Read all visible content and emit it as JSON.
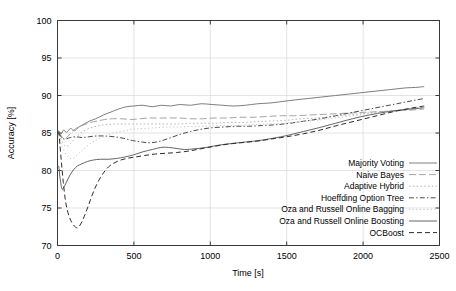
{
  "chart_data": {
    "type": "line",
    "title": "",
    "xlabel": "Time [s]",
    "ylabel": "Accuracy [%]",
    "xlim": [
      0,
      2500
    ],
    "ylim": [
      70,
      100
    ],
    "xticks": [
      0,
      500,
      1000,
      1500,
      2000,
      2500
    ],
    "yticks": [
      70,
      75,
      80,
      85,
      90,
      95,
      100
    ],
    "xtick_labels": [
      "0",
      "500",
      "1000",
      "1500",
      "2000",
      "2500"
    ],
    "ytick_labels": [
      "70",
      "75",
      "80",
      "85",
      "90",
      "95",
      "100"
    ],
    "grid": true,
    "grid_style": "light-solid",
    "legend_position": "lower-right-inside",
    "series": [
      {
        "name": "Majority Voting",
        "style": "solid",
        "color": "#6f6f6f",
        "width": 0.9,
        "x": [
          10,
          25,
          40,
          60,
          85,
          110,
          140,
          175,
          210,
          250,
          300,
          350,
          400,
          450,
          500,
          560,
          620,
          680,
          740,
          800,
          870,
          940,
          1010,
          1080,
          1150,
          1230,
          1310,
          1390,
          1470,
          1550,
          1640,
          1730,
          1820,
          1910,
          2000,
          2090,
          2180,
          2270,
          2360,
          2400
        ],
        "y": [
          85.2,
          84.9,
          85.4,
          85.1,
          85.6,
          85.3,
          85.8,
          86.2,
          86.6,
          86.9,
          87.4,
          87.8,
          88.2,
          88.5,
          88.6,
          88.7,
          88.5,
          88.7,
          88.6,
          88.8,
          88.7,
          88.9,
          88.8,
          88.7,
          88.6,
          88.7,
          88.9,
          89.0,
          89.2,
          89.4,
          89.6,
          89.8,
          90.0,
          90.2,
          90.4,
          90.6,
          90.8,
          91.0,
          91.1,
          91.2
        ]
      },
      {
        "name": "Naive Bayes",
        "style": "long-dash",
        "color": "#9a9a9a",
        "width": 0.9,
        "x": [
          10,
          25,
          45,
          70,
          100,
          135,
          175,
          215,
          260,
          310,
          360,
          420,
          480,
          540,
          600,
          660,
          730,
          800,
          870,
          950,
          1030,
          1110,
          1190,
          1280,
          1370,
          1460,
          1550,
          1650,
          1750,
          1850,
          1950,
          2050,
          2150,
          2250,
          2350,
          2400
        ],
        "y": [
          85.1,
          84.6,
          84.2,
          84.6,
          85.3,
          85.8,
          86.1,
          86.4,
          86.6,
          86.8,
          86.9,
          86.9,
          86.8,
          86.9,
          87.0,
          87.0,
          87.0,
          87.0,
          86.9,
          86.9,
          87.0,
          87.0,
          87.1,
          87.1,
          87.2,
          87.3,
          87.3,
          87.4,
          87.5,
          87.6,
          87.7,
          87.8,
          87.9,
          88.0,
          88.1,
          88.2
        ]
      },
      {
        "name": "Adaptive Hybrid",
        "style": "dotted",
        "color": "#b0b0b0",
        "width": 0.9,
        "x": [
          10,
          30,
          55,
          85,
          120,
          160,
          205,
          255,
          310,
          370,
          430,
          500,
          570,
          640,
          710,
          790,
          870,
          950,
          1030,
          1120,
          1210,
          1300,
          1400,
          1500,
          1600,
          1700,
          1800,
          1900,
          2000,
          2100,
          2200,
          2300,
          2400
        ],
        "y": [
          84.8,
          83.9,
          83.2,
          83.6,
          84.4,
          85.1,
          85.6,
          85.9,
          86.1,
          86.2,
          86.2,
          86.2,
          86.2,
          86.2,
          86.2,
          86.2,
          86.3,
          86.3,
          86.3,
          86.4,
          86.4,
          86.5,
          86.6,
          86.7,
          86.9,
          87.0,
          87.2,
          87.4,
          87.6,
          87.8,
          88.0,
          88.2,
          88.4
        ]
      },
      {
        "name": "Hoeffding Option Tree",
        "style": "dash-dot",
        "color": "#4a4a4a",
        "width": 1.0,
        "x": [
          10,
          30,
          55,
          85,
          120,
          160,
          205,
          255,
          310,
          370,
          430,
          490,
          550,
          610,
          670,
          730,
          800,
          870,
          940,
          1010,
          1090,
          1170,
          1250,
          1340,
          1430,
          1520,
          1620,
          1720,
          1820,
          1920,
          2020,
          2120,
          2220,
          2320,
          2400
        ],
        "y": [
          85.0,
          84.3,
          84.2,
          84.4,
          84.5,
          84.4,
          84.5,
          84.6,
          84.6,
          84.5,
          84.3,
          84.0,
          83.8,
          83.7,
          83.9,
          84.3,
          84.8,
          85.2,
          85.5,
          85.7,
          85.8,
          85.9,
          85.9,
          86.0,
          86.1,
          86.3,
          86.6,
          86.9,
          87.3,
          87.7,
          88.1,
          88.5,
          88.9,
          89.3,
          89.6
        ]
      },
      {
        "name": "Oza and Russell Online Bagging",
        "style": "dotted-light",
        "color": "#bdbdbd",
        "width": 0.9,
        "x": [
          10,
          30,
          60,
          95,
          135,
          180,
          230,
          290,
          350,
          420,
          490,
          560,
          640,
          720,
          800,
          890,
          980,
          1070,
          1170,
          1270,
          1370,
          1480,
          1590,
          1700,
          1810,
          1930,
          2050,
          2170,
          2290,
          2400
        ],
        "y": [
          84.6,
          83.2,
          82.0,
          81.6,
          82.2,
          83.0,
          83.8,
          84.4,
          84.9,
          85.2,
          85.5,
          85.6,
          85.7,
          85.8,
          85.8,
          85.9,
          85.9,
          86.0,
          86.0,
          86.1,
          86.2,
          86.3,
          86.5,
          86.7,
          87.0,
          87.3,
          87.6,
          87.9,
          88.2,
          88.5
        ]
      },
      {
        "name": "Oza and Russell Online Boosting",
        "style": "solid",
        "color": "#555555",
        "width": 0.9,
        "x": [
          8,
          18,
          30,
          45,
          62,
          82,
          105,
          130,
          160,
          195,
          235,
          280,
          330,
          385,
          440,
          500,
          560,
          620,
          690,
          760,
          830,
          900,
          980,
          1060,
          1140,
          1230,
          1320,
          1410,
          1510,
          1610,
          1710,
          1820,
          1930,
          2040,
          2150,
          2260,
          2370,
          2400
        ],
        "y": [
          80.6,
          78.8,
          77.5,
          77.9,
          78.6,
          79.4,
          80.1,
          80.6,
          80.9,
          81.2,
          81.4,
          81.5,
          81.5,
          81.6,
          81.8,
          82.1,
          82.5,
          82.8,
          83.1,
          83.0,
          82.8,
          82.9,
          83.1,
          83.4,
          83.6,
          83.8,
          84.0,
          84.3,
          84.7,
          85.2,
          85.7,
          86.3,
          86.9,
          87.4,
          87.8,
          88.1,
          88.3,
          88.4
        ]
      },
      {
        "name": "OCBoost",
        "style": "dashed",
        "color": "#2b2b2b",
        "width": 1.0,
        "x": [
          8,
          16,
          26,
          38,
          52,
          68,
          88,
          110,
          135,
          165,
          200,
          240,
          285,
          335,
          390,
          450,
          510,
          570,
          640,
          710,
          780,
          860,
          940,
          1020,
          1110,
          1200,
          1300,
          1400,
          1500,
          1610,
          1720,
          1830,
          1950,
          2070,
          2190,
          2310,
          2400
        ],
        "y": [
          85.3,
          83.4,
          81.0,
          78.4,
          76.0,
          74.4,
          73.3,
          72.6,
          72.4,
          73.4,
          75.2,
          77.4,
          79.2,
          80.5,
          81.2,
          81.6,
          81.8,
          82.0,
          82.2,
          82.3,
          82.4,
          82.6,
          82.9,
          83.2,
          83.5,
          83.7,
          83.9,
          84.2,
          84.5,
          84.9,
          85.4,
          86.0,
          86.6,
          87.2,
          87.8,
          88.3,
          88.6
        ]
      }
    ]
  },
  "legend": {
    "items": [
      {
        "label": "Majority Voting"
      },
      {
        "label": "Naive Bayes"
      },
      {
        "label": "Adaptive Hybrid"
      },
      {
        "label": "Hoeffding Option Tree"
      },
      {
        "label": "Oza and Russell Online Bagging"
      },
      {
        "label": "Oza and Russell Online Boosting"
      },
      {
        "label": "OCBoost"
      }
    ]
  },
  "colors": {
    "frame": "#3a3a3a",
    "grid": "#d9d9d9",
    "text": "#000000",
    "background": "#ffffff"
  }
}
